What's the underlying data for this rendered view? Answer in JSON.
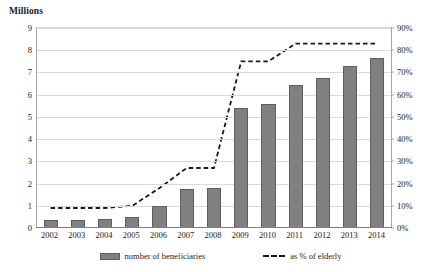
{
  "chart_data": {
    "type": "bar",
    "title": "",
    "subtitle": "",
    "ylabel": "Millions",
    "y2label": "",
    "xlabel": "",
    "grid": true,
    "legend_position": "bottom",
    "categories": [
      "2002",
      "2003",
      "2004",
      "2005",
      "2006",
      "2007",
      "2008",
      "2009",
      "2010",
      "2011",
      "2012",
      "2013",
      "2014"
    ],
    "ylim": [
      0,
      9
    ],
    "yticks": [
      "0",
      "1",
      "2",
      "3",
      "4",
      "5",
      "6",
      "7",
      "8",
      "9"
    ],
    "y2lim": [
      0,
      90
    ],
    "y2ticks": [
      "0%",
      "10%",
      "20%",
      "30%",
      "40%",
      "50%",
      "60%",
      "70%",
      "80%",
      "90%"
    ],
    "series": [
      {
        "name": "number of beneficiaries",
        "type": "bar",
        "axis": "left",
        "units": "millions",
        "color": "#808080",
        "values": [
          0.35,
          0.35,
          0.4,
          0.5,
          1.0,
          1.75,
          1.8,
          5.4,
          5.6,
          6.45,
          6.75,
          7.3,
          7.65
        ]
      },
      {
        "name": "as % of elderly",
        "type": "line",
        "axis": "right",
        "units": "percent",
        "color": "#1a1a1a",
        "style": "dashed",
        "values": [
          9,
          9,
          9,
          10,
          18,
          27,
          27,
          75,
          75,
          83,
          83,
          83,
          83
        ]
      }
    ]
  },
  "axis": {
    "left_title": "Millions"
  },
  "legend": {
    "items": [
      {
        "label": "number of beneficiaries",
        "marker": "bar-swatch-icon"
      },
      {
        "label": "as % of elderly",
        "marker": "dashed-line-swatch-icon"
      }
    ]
  }
}
